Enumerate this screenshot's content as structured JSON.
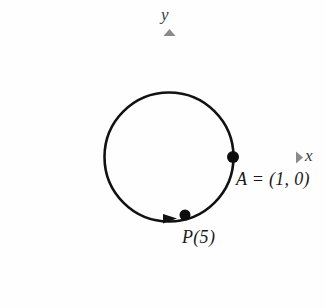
{
  "figure": {
    "caption": "Unit circle with point A at (1, 0) and point P(5) on the circle",
    "background_color": "#fefefe",
    "axis_color": "#8a8a8a",
    "curve_color": "#111111",
    "text_color": "#1a1a1a"
  },
  "axes": {
    "x": {
      "label": "x",
      "start_px": 22,
      "end_px": 300,
      "y_px": 157,
      "arrow": "right"
    },
    "y": {
      "label": "y",
      "start_px": 302,
      "end_px": 30,
      "x_px": 169,
      "arrow": "up"
    },
    "origin_px": [
      169,
      157
    ]
  },
  "chart_data": {
    "type": "scatter",
    "title": "",
    "xlabel": "x",
    "ylabel": "y",
    "grid": false,
    "legend": null,
    "xlim": [
      -2.3,
      2.0
    ],
    "ylim": [
      -2.2,
      1.9
    ],
    "shapes": [
      {
        "kind": "circle",
        "name": "unit-circle",
        "center": [
          0,
          0
        ],
        "radius": 1,
        "center_px": [
          169,
          157
        ],
        "radius_px": 64.5,
        "stroke": "#111111",
        "fill": "none"
      }
    ],
    "annotations": [
      {
        "name": "direction-arrow",
        "kind": "arrowhead",
        "on": "unit-circle",
        "at_px": [
          170,
          219
        ],
        "direction": "counterclockwise",
        "note": "arrowhead on circle at bottom pointing right"
      }
    ],
    "points": [
      {
        "name": "A",
        "label": "A = (1, 0)",
        "x": 1,
        "y": 0,
        "px": [
          233,
          157
        ],
        "marker": "filled-circle",
        "marker_radius_px": 6,
        "label_px": [
          236,
          170
        ]
      },
      {
        "name": "P(5)",
        "label": "P(5)",
        "x": 0.245,
        "y": -0.969,
        "px": [
          185,
          215
        ],
        "marker": "filled-circle",
        "marker_radius_px": 5.5,
        "label_px": [
          182,
          228
        ]
      }
    ]
  },
  "labels": {
    "y_axis": "y",
    "x_axis": "x",
    "point_a": "A = (1, 0)",
    "point_p": "P(5)"
  }
}
